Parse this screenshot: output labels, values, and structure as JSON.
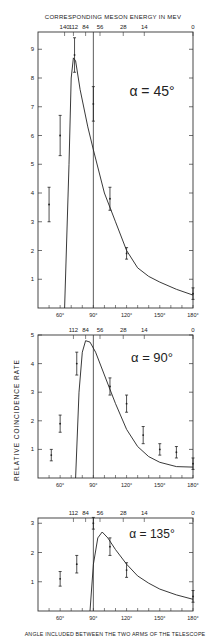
{
  "page": {
    "top_xlabel": "CORRESPONDING MESON ENERGY IN MEV",
    "ylabel": "RELATIVE COINCIDENCE RATE",
    "bottom_xlabel": "ANGLE INCLUDED BETWEEN THE TWO ARMS OF THE TELESCOPE"
  },
  "chart_data": [
    {
      "type": "scatter",
      "title": "α = 45°",
      "xlabel": "Angle included between the two arms of the telescope",
      "ylabel": "Relative coincidence rate",
      "top_axis_label": "Corresponding meson energy in MeV",
      "top_ticks": [
        "140",
        "112",
        "84",
        "56",
        "28",
        "14",
        "0"
      ],
      "bottom_ticks": [
        "60°",
        "90°",
        "120°",
        "150°",
        "180°"
      ],
      "y_ticks": [
        "1",
        "2",
        "3",
        "4",
        "5",
        "6",
        "7",
        "8",
        "9"
      ],
      "xlim": [
        40,
        180
      ],
      "ylim": [
        0,
        9.5
      ],
      "vertical_line_x": 90,
      "points": [
        {
          "x": 50,
          "y": 3.6,
          "err": 0.6
        },
        {
          "x": 60,
          "y": 6.0,
          "err": 0.7
        },
        {
          "x": 73,
          "y": 8.8,
          "err": 0.6
        },
        {
          "x": 90,
          "y": 7.1,
          "err": 0.6
        },
        {
          "x": 105,
          "y": 3.8,
          "err": 0.4
        },
        {
          "x": 120,
          "y": 1.9,
          "err": 0.2
        },
        {
          "x": 180,
          "y": 0.5,
          "err": 0.2
        }
      ],
      "curve": [
        [
          64,
          0
        ],
        [
          68,
          5
        ],
        [
          70,
          8.0
        ],
        [
          72,
          8.7
        ],
        [
          74,
          8.6
        ],
        [
          78,
          7.6
        ],
        [
          85,
          6.3
        ],
        [
          90,
          5.5
        ],
        [
          100,
          4.0
        ],
        [
          110,
          3.0
        ],
        [
          120,
          2.0
        ],
        [
          130,
          1.4
        ],
        [
          140,
          1.1
        ],
        [
          150,
          0.9
        ],
        [
          165,
          0.65
        ],
        [
          180,
          0.45
        ]
      ]
    },
    {
      "type": "scatter",
      "title": "α = 90°",
      "xlabel": "Angle included between the two arms of the telescope",
      "ylabel": "Relative coincidence rate",
      "top_ticks": [
        "112",
        "84",
        "56",
        "28",
        "14",
        "0"
      ],
      "bottom_ticks": [
        "60°",
        "90°",
        "120°",
        "150°",
        "180°"
      ],
      "y_ticks": [
        "1",
        "2",
        "3",
        "4",
        "5"
      ],
      "xlim": [
        40,
        180
      ],
      "ylim": [
        0,
        5
      ],
      "vertical_line_x": 90,
      "points": [
        {
          "x": 52,
          "y": 0.8,
          "err": 0.2
        },
        {
          "x": 60,
          "y": 1.9,
          "err": 0.3
        },
        {
          "x": 75,
          "y": 4.0,
          "err": 0.4
        },
        {
          "x": 105,
          "y": 3.2,
          "err": 0.3
        },
        {
          "x": 120,
          "y": 2.6,
          "err": 0.3
        },
        {
          "x": 135,
          "y": 1.5,
          "err": 0.3
        },
        {
          "x": 150,
          "y": 1.0,
          "err": 0.2
        },
        {
          "x": 165,
          "y": 0.9,
          "err": 0.2
        },
        {
          "x": 180,
          "y": 0.5,
          "err": 0.2
        }
      ],
      "curve": [
        [
          74,
          0
        ],
        [
          77,
          3.0
        ],
        [
          80,
          4.4
        ],
        [
          83,
          4.8
        ],
        [
          87,
          4.75
        ],
        [
          92,
          4.4
        ],
        [
          100,
          3.6
        ],
        [
          110,
          2.6
        ],
        [
          120,
          1.7
        ],
        [
          130,
          1.1
        ],
        [
          140,
          0.75
        ],
        [
          150,
          0.55
        ],
        [
          165,
          0.4
        ],
        [
          180,
          0.38
        ]
      ]
    },
    {
      "type": "scatter",
      "title": "α = 135°",
      "xlabel": "Angle included between the two arms of the telescope",
      "ylabel": "Relative coincidence rate",
      "top_ticks": [
        "112",
        "84",
        "56",
        "28",
        "14",
        "0"
      ],
      "bottom_ticks": [
        "60°",
        "90°",
        "120°",
        "150°",
        "180°"
      ],
      "y_ticks": [
        "1",
        "2",
        "3"
      ],
      "xlim": [
        40,
        180
      ],
      "ylim": [
        0,
        3.1
      ],
      "vertical_line_x": 90,
      "points": [
        {
          "x": 60,
          "y": 1.1,
          "err": 0.25
        },
        {
          "x": 75,
          "y": 1.6,
          "err": 0.3
        },
        {
          "x": 90,
          "y": 3.0,
          "err": 0.2
        },
        {
          "x": 105,
          "y": 2.2,
          "err": 0.3
        },
        {
          "x": 120,
          "y": 1.4,
          "err": 0.25
        },
        {
          "x": 180,
          "y": 0.5,
          "err": 0.2
        }
      ],
      "curve": [
        [
          87,
          0
        ],
        [
          90,
          1.6
        ],
        [
          94,
          2.5
        ],
        [
          98,
          2.7
        ],
        [
          103,
          2.5
        ],
        [
          110,
          2.1
        ],
        [
          120,
          1.6
        ],
        [
          130,
          1.2
        ],
        [
          140,
          0.95
        ],
        [
          150,
          0.75
        ],
        [
          165,
          0.55
        ],
        [
          180,
          0.4
        ]
      ]
    }
  ]
}
